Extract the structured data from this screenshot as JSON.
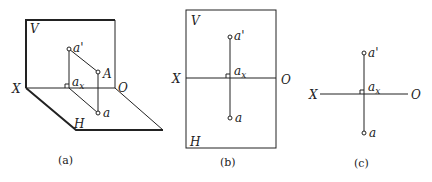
{
  "figure": {
    "panels": [
      {
        "id": "a",
        "caption": "(a)",
        "type": "3d-projection",
        "labels": {
          "V": "V",
          "H": "H",
          "X": "X",
          "O": "O",
          "a_prime": "a'",
          "A": "A",
          "ax": "a",
          "ax_sub": "x",
          "a": "a"
        }
      },
      {
        "id": "b",
        "caption": "(b)",
        "type": "unfolded-projection-with-planes",
        "labels": {
          "V": "V",
          "H": "H",
          "X": "X",
          "O": "O",
          "a_prime": "a'",
          "ax": "a",
          "ax_sub": "x",
          "a": "a"
        }
      },
      {
        "id": "c",
        "caption": "(c)",
        "type": "projection-without-plane-borders",
        "labels": {
          "X": "X",
          "O": "O",
          "a_prime": "a'",
          "ax": "a",
          "ax_sub": "x",
          "a": "a"
        }
      }
    ]
  }
}
